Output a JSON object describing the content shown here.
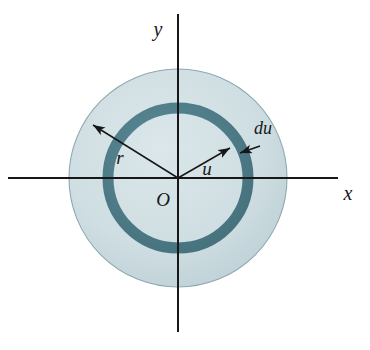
{
  "figure": {
    "background_color": "#ffffff",
    "ink_color": "#171717",
    "disk_fill_color": "#cfdee2",
    "disk_edge_color": "#8fa8b0",
    "ring_color": "#4f7d8c",
    "axes": {
      "x_label": "x",
      "y_label": "y",
      "origin_label": "O",
      "x_axis_name": "horizontal axis",
      "y_axis_name": "vertical axis",
      "x_start_px": 8,
      "x_end_px": 338,
      "y_start_px": 14,
      "y_end_px": 332,
      "origin_x_px": 178,
      "origin_y_px": 178
    },
    "geometry": {
      "outer_disk_radius_px": 109,
      "ring_mid_radius_px": 70,
      "ring_thickness_px": 11,
      "ring_inner_radius_px": 64.5,
      "ring_outer_radius_px": 75.5
    },
    "annotations": [
      {
        "name": "radius-r",
        "label": "r",
        "description": "arrow from origin to outer disk edge, upper-left",
        "label_x_px": 120,
        "label_y_px": 158,
        "tip_x_px": 92,
        "tip_y_px": 124
      },
      {
        "name": "radius-u",
        "label": "u",
        "description": "arrow from origin to inner edge of shaded ring, upper-right",
        "label_x_px": 207,
        "label_y_px": 172,
        "tip_x_px": 231,
        "tip_y_px": 147
      },
      {
        "name": "thickness-du",
        "label": "du",
        "description": "arrow pointing down-left at the shaded ring band",
        "label_x_px": 250,
        "label_y_px": 137,
        "tip_x_px": 241,
        "tip_y_px": 152
      }
    ]
  }
}
